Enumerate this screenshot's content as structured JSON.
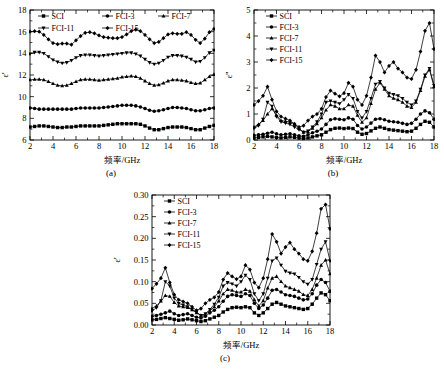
{
  "figure": {
    "panels": [
      "a",
      "b",
      "c"
    ],
    "caption_a": "(a)",
    "caption_b": "(b)",
    "caption_c": "(c)",
    "xlabel": "频率/GHz",
    "series_names": [
      "SCI",
      "FCI-3",
      "FCI-7",
      "FCI-11",
      "FCI-15"
    ],
    "markers": [
      "square",
      "circle",
      "triangle-up",
      "triangle-down",
      "diamond"
    ],
    "line_color": "#000000"
  },
  "chart_data": [
    {
      "type": "line",
      "panel": "a",
      "title": "",
      "xlabel": "频率/GHz",
      "ylabel": "ε'",
      "xlim": [
        2,
        18
      ],
      "ylim": [
        6,
        18
      ],
      "xticks": [
        2,
        4,
        6,
        8,
        10,
        12,
        14,
        16,
        18
      ],
      "yticks": [
        6,
        8,
        10,
        12,
        14,
        16,
        18
      ],
      "grid": false,
      "legend_position": "top-inside",
      "x": [
        2.0,
        2.4,
        2.8,
        3.2,
        3.6,
        4.0,
        4.4,
        4.8,
        5.2,
        5.6,
        6.0,
        6.4,
        6.8,
        7.2,
        7.6,
        8.0,
        8.4,
        8.8,
        9.2,
        9.6,
        10.0,
        10.4,
        10.8,
        11.2,
        11.6,
        12.0,
        12.4,
        12.8,
        13.2,
        13.6,
        14.0,
        14.4,
        14.8,
        15.2,
        15.6,
        16.0,
        16.4,
        16.8,
        17.2,
        17.6,
        18.0
      ],
      "series": [
        {
          "name": "SCI",
          "marker": "square",
          "values": [
            7.2,
            7.25,
            7.3,
            7.3,
            7.25,
            7.2,
            7.15,
            7.15,
            7.2,
            7.2,
            7.25,
            7.3,
            7.3,
            7.3,
            7.3,
            7.3,
            7.35,
            7.4,
            7.45,
            7.5,
            7.5,
            7.5,
            7.5,
            7.5,
            7.45,
            7.3,
            7.1,
            6.95,
            6.95,
            7.05,
            7.15,
            7.2,
            7.2,
            7.2,
            7.15,
            7.05,
            6.95,
            6.95,
            7.1,
            7.25,
            7.35
          ]
        },
        {
          "name": "FCI-3",
          "marker": "circle",
          "values": [
            8.95,
            8.9,
            8.85,
            8.85,
            8.85,
            8.85,
            8.85,
            8.85,
            8.85,
            8.85,
            8.9,
            8.95,
            8.95,
            8.95,
            8.95,
            8.95,
            9.0,
            9.05,
            9.1,
            9.15,
            9.2,
            9.2,
            9.2,
            9.15,
            9.05,
            8.9,
            8.75,
            8.65,
            8.7,
            8.8,
            8.9,
            9.0,
            9.0,
            8.95,
            8.9,
            8.8,
            8.7,
            8.7,
            8.8,
            8.9,
            8.95
          ]
        },
        {
          "name": "FCI-7",
          "marker": "triangle-up",
          "values": [
            11.55,
            11.6,
            11.6,
            11.55,
            11.4,
            11.2,
            11.05,
            11.0,
            11.05,
            11.2,
            11.4,
            11.55,
            11.6,
            11.6,
            11.55,
            11.5,
            11.55,
            11.6,
            11.65,
            11.7,
            11.8,
            11.85,
            11.9,
            11.85,
            11.7,
            11.45,
            11.2,
            11.05,
            11.1,
            11.25,
            11.45,
            11.55,
            11.55,
            11.5,
            11.45,
            11.3,
            11.2,
            11.25,
            11.55,
            11.85,
            12.05
          ]
        },
        {
          "name": "FCI-11",
          "marker": "triangle-down",
          "values": [
            13.95,
            14.1,
            14.1,
            14.0,
            13.7,
            13.4,
            13.2,
            13.1,
            13.15,
            13.35,
            13.6,
            13.8,
            13.85,
            13.85,
            13.8,
            13.75,
            13.8,
            13.85,
            13.9,
            13.95,
            14.0,
            14.05,
            14.05,
            13.95,
            13.75,
            13.45,
            13.15,
            13.0,
            13.1,
            13.35,
            13.65,
            13.8,
            13.8,
            13.75,
            13.65,
            13.45,
            13.2,
            13.25,
            13.6,
            14.05,
            14.3
          ]
        },
        {
          "name": "FCI-15",
          "marker": "diamond",
          "values": [
            16.0,
            16.05,
            16.0,
            15.7,
            15.3,
            14.95,
            14.85,
            14.9,
            14.9,
            14.8,
            15.2,
            15.6,
            15.9,
            15.95,
            15.85,
            15.65,
            15.5,
            15.45,
            15.4,
            15.4,
            15.5,
            15.75,
            16.05,
            16.2,
            16.05,
            15.7,
            15.3,
            14.95,
            15.05,
            15.4,
            15.75,
            15.85,
            15.8,
            15.8,
            15.95,
            15.7,
            15.25,
            14.95,
            15.35,
            15.95,
            16.25
          ]
        }
      ]
    },
    {
      "type": "line",
      "panel": "b",
      "title": "",
      "xlabel": "频率/GHz",
      "ylabel": "ε''",
      "xlim": [
        2,
        18
      ],
      "ylim": [
        0,
        5
      ],
      "xticks": [
        2,
        4,
        6,
        8,
        10,
        12,
        14,
        16,
        18
      ],
      "yticks": [
        0,
        1,
        2,
        3,
        4,
        5
      ],
      "grid": false,
      "legend_position": "top-left-inside",
      "x": [
        2.0,
        2.4,
        2.8,
        3.2,
        3.6,
        4.0,
        4.4,
        4.8,
        5.2,
        5.6,
        6.0,
        6.4,
        6.8,
        7.2,
        7.6,
        8.0,
        8.4,
        8.8,
        9.2,
        9.6,
        10.0,
        10.4,
        10.8,
        11.2,
        11.6,
        12.0,
        12.4,
        12.8,
        13.2,
        13.6,
        14.0,
        14.4,
        14.8,
        15.2,
        15.6,
        16.0,
        16.4,
        16.8,
        17.2,
        17.6,
        18.0
      ],
      "series": [
        {
          "name": "SCI",
          "marker": "square",
          "values": [
            0.08,
            0.1,
            0.12,
            0.14,
            0.12,
            0.1,
            0.08,
            0.1,
            0.12,
            0.1,
            0.08,
            0.06,
            0.08,
            0.12,
            0.16,
            0.2,
            0.3,
            0.4,
            0.45,
            0.46,
            0.44,
            0.46,
            0.44,
            0.3,
            0.22,
            0.25,
            0.35,
            0.45,
            0.5,
            0.45,
            0.4,
            0.38,
            0.36,
            0.34,
            0.32,
            0.34,
            0.45,
            0.6,
            0.72,
            0.68,
            0.5
          ]
        },
        {
          "name": "FCI-3",
          "marker": "circle",
          "values": [
            0.18,
            0.2,
            0.22,
            0.26,
            0.3,
            0.24,
            0.2,
            0.22,
            0.24,
            0.2,
            0.16,
            0.14,
            0.2,
            0.28,
            0.34,
            0.42,
            0.6,
            0.78,
            0.82,
            0.8,
            0.78,
            0.85,
            0.8,
            0.56,
            0.42,
            0.5,
            0.65,
            0.8,
            0.82,
            0.78,
            0.72,
            0.7,
            0.68,
            0.64,
            0.6,
            0.64,
            0.8,
            1.0,
            1.12,
            1.05,
            0.8
          ]
        },
        {
          "name": "FCI-7",
          "marker": "triangle-up",
          "values": [
            0.5,
            0.6,
            0.75,
            1.0,
            1.2,
            0.95,
            0.75,
            0.72,
            0.7,
            0.6,
            0.45,
            0.3,
            0.32,
            0.45,
            0.62,
            0.85,
            1.15,
            1.35,
            1.3,
            1.2,
            1.2,
            1.35,
            1.3,
            0.95,
            0.68,
            0.85,
            1.4,
            1.95,
            2.2,
            1.95,
            1.7,
            1.6,
            1.55,
            1.45,
            1.3,
            1.25,
            1.45,
            1.9,
            2.45,
            2.7,
            2.05
          ]
        },
        {
          "name": "FCI-11",
          "marker": "triangle-down",
          "values": [
            0.45,
            0.55,
            0.8,
            1.45,
            1.3,
            0.9,
            0.7,
            0.65,
            0.6,
            0.5,
            0.4,
            0.3,
            0.35,
            0.5,
            0.7,
            1.0,
            1.45,
            1.5,
            1.45,
            1.4,
            1.55,
            1.75,
            1.6,
            1.1,
            0.85,
            1.1,
            1.6,
            2.15,
            2.25,
            2.0,
            1.8,
            1.75,
            1.7,
            1.6,
            1.45,
            1.35,
            1.5,
            1.95,
            2.5,
            2.75,
            2.1
          ]
        },
        {
          "name": "FCI-15",
          "marker": "diamond",
          "values": [
            1.35,
            1.5,
            1.7,
            2.05,
            1.55,
            1.1,
            0.9,
            0.82,
            0.75,
            0.62,
            0.5,
            0.55,
            0.75,
            0.9,
            1.0,
            1.2,
            1.65,
            1.9,
            1.78,
            1.68,
            1.8,
            2.2,
            2.05,
            1.55,
            1.35,
            1.7,
            2.4,
            3.25,
            3.0,
            2.6,
            2.85,
            3.0,
            2.75,
            2.6,
            2.4,
            2.35,
            2.7,
            3.4,
            4.2,
            4.5,
            3.5
          ]
        }
      ]
    },
    {
      "type": "line",
      "panel": "c",
      "title": "",
      "xlabel": "频率/GHz",
      "ylabel": "ε'",
      "xlim": [
        2,
        18
      ],
      "ylim": [
        0.0,
        0.3
      ],
      "xticks": [
        2,
        4,
        6,
        8,
        10,
        12,
        14,
        16,
        18
      ],
      "yticks": [
        0.0,
        0.05,
        0.1,
        0.15,
        0.2,
        0.25,
        0.3
      ],
      "grid": false,
      "legend_position": "top-left-inside",
      "x": [
        2.0,
        2.4,
        2.8,
        3.2,
        3.6,
        4.0,
        4.4,
        4.8,
        5.2,
        5.6,
        6.0,
        6.4,
        6.8,
        7.2,
        7.6,
        8.0,
        8.4,
        8.8,
        9.2,
        9.6,
        10.0,
        10.4,
        10.8,
        11.2,
        11.6,
        12.0,
        12.4,
        12.8,
        13.2,
        13.6,
        14.0,
        14.4,
        14.8,
        15.2,
        15.6,
        16.0,
        16.4,
        16.8,
        17.2,
        17.6,
        18.0
      ],
      "series": [
        {
          "name": "SCI",
          "marker": "square",
          "values": [
            0.012,
            0.013,
            0.015,
            0.017,
            0.015,
            0.013,
            0.011,
            0.012,
            0.014,
            0.012,
            0.01,
            0.008,
            0.01,
            0.014,
            0.018,
            0.022,
            0.03,
            0.036,
            0.04,
            0.041,
            0.04,
            0.042,
            0.04,
            0.028,
            0.022,
            0.028,
            0.038,
            0.048,
            0.052,
            0.048,
            0.044,
            0.042,
            0.04,
            0.038,
            0.036,
            0.038,
            0.048,
            0.062,
            0.074,
            0.07,
            0.056
          ]
        },
        {
          "name": "FCI-3",
          "marker": "circle",
          "values": [
            0.02,
            0.022,
            0.025,
            0.028,
            0.032,
            0.026,
            0.022,
            0.024,
            0.026,
            0.022,
            0.018,
            0.016,
            0.02,
            0.028,
            0.034,
            0.042,
            0.055,
            0.066,
            0.07,
            0.068,
            0.066,
            0.072,
            0.068,
            0.05,
            0.038,
            0.046,
            0.062,
            0.08,
            0.082,
            0.076,
            0.07,
            0.068,
            0.066,
            0.062,
            0.058,
            0.06,
            0.072,
            0.092,
            0.105,
            0.098,
            0.078
          ]
        },
        {
          "name": "FCI-7",
          "marker": "triangle-up",
          "values": [
            0.038,
            0.044,
            0.055,
            0.068,
            0.066,
            0.052,
            0.044,
            0.042,
            0.04,
            0.035,
            0.028,
            0.022,
            0.024,
            0.032,
            0.042,
            0.055,
            0.072,
            0.082,
            0.08,
            0.076,
            0.076,
            0.082,
            0.078,
            0.058,
            0.044,
            0.056,
            0.085,
            0.108,
            0.112,
            0.1,
            0.09,
            0.086,
            0.082,
            0.078,
            0.07,
            0.068,
            0.082,
            0.108,
            0.138,
            0.15,
            0.118
          ]
        },
        {
          "name": "FCI-11",
          "marker": "triangle-down",
          "values": [
            0.032,
            0.04,
            0.056,
            0.1,
            0.09,
            0.062,
            0.05,
            0.046,
            0.042,
            0.036,
            0.03,
            0.022,
            0.026,
            0.036,
            0.048,
            0.064,
            0.09,
            0.098,
            0.095,
            0.09,
            0.1,
            0.115,
            0.105,
            0.072,
            0.056,
            0.072,
            0.108,
            0.148,
            0.155,
            0.138,
            0.124,
            0.12,
            0.118,
            0.11,
            0.1,
            0.094,
            0.105,
            0.14,
            0.175,
            0.192,
            0.148
          ]
        },
        {
          "name": "FCI-15",
          "marker": "diamond",
          "values": [
            0.084,
            0.095,
            0.108,
            0.132,
            0.098,
            0.07,
            0.058,
            0.054,
            0.05,
            0.042,
            0.034,
            0.038,
            0.05,
            0.058,
            0.064,
            0.076,
            0.105,
            0.12,
            0.112,
            0.106,
            0.112,
            0.138,
            0.128,
            0.098,
            0.086,
            0.108,
            0.152,
            0.21,
            0.192,
            0.165,
            0.18,
            0.19,
            0.175,
            0.165,
            0.152,
            0.148,
            0.17,
            0.212,
            0.268,
            0.278,
            0.222
          ]
        }
      ]
    }
  ]
}
